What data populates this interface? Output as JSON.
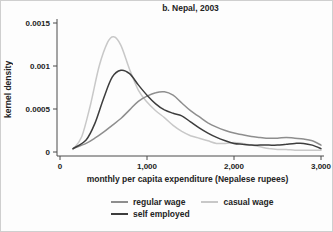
{
  "title": "b. Nepal, 2003",
  "colors": {
    "background": "#fdfdfd",
    "axis": "#4a4a4a",
    "text": "#232323",
    "regular_wage": "#8e8e8e",
    "casual_wage": "#c8c8c8",
    "self_employed": "#3d3d3d"
  },
  "chart_data": {
    "type": "line",
    "title": "b. Nepal, 2003",
    "xlabel": "monthly per capita expenditure (Nepalese rupees)",
    "ylabel": "kernel density",
    "xlim": [
      0,
      3000
    ],
    "ylim": [
      0,
      0.0015
    ],
    "grid": false,
    "legend_position": "bottom",
    "xticks": [
      {
        "value": 0,
        "label": "0"
      },
      {
        "value": 1000,
        "label": "1,000"
      },
      {
        "value": 2000,
        "label": "2,000"
      },
      {
        "value": 3000,
        "label": "3,000"
      }
    ],
    "yticks": [
      {
        "value": 0,
        "label": "0"
      },
      {
        "value": 0.0005,
        "label": "0.0005"
      },
      {
        "value": 0.001,
        "label": "0.001"
      },
      {
        "value": 0.0015,
        "label": "0.0015"
      }
    ],
    "series": [
      {
        "name": "casual wage",
        "color": "#c8c8c8",
        "x": [
          150,
          250,
          350,
          450,
          550,
          620,
          700,
          800,
          900,
          1000,
          1100,
          1200,
          1300,
          1400,
          1500,
          1600,
          1700,
          1800,
          1900,
          2000,
          2100,
          2200,
          2300,
          2400,
          2500,
          2600,
          2700,
          2800,
          2900,
          3000
        ],
        "y": [
          3e-05,
          0.00018,
          0.00055,
          0.001,
          0.00128,
          0.00134,
          0.00124,
          0.00096,
          0.00072,
          0.00058,
          0.00048,
          0.0004,
          0.00031,
          0.00024,
          0.00019,
          0.00016,
          0.00013,
          0.0001,
          0.0001,
          0.00011,
          0.0001,
          8e-05,
          6e-05,
          4e-05,
          3e-05,
          3e-05,
          2e-05,
          2e-05,
          2e-05,
          2e-05
        ]
      },
      {
        "name": "regular wage",
        "color": "#8e8e8e",
        "x": [
          150,
          300,
          400,
          500,
          600,
          700,
          800,
          900,
          1000,
          1100,
          1200,
          1300,
          1400,
          1500,
          1600,
          1700,
          1800,
          1900,
          2000,
          2100,
          2200,
          2300,
          2400,
          2500,
          2600,
          2700,
          2800,
          2900,
          3000
        ],
        "y": [
          4e-05,
          0.0001,
          0.00016,
          0.00023,
          0.00031,
          0.00039,
          0.00049,
          0.00059,
          0.00065,
          0.00069,
          0.0007,
          0.00066,
          0.00057,
          0.00048,
          0.00041,
          0.00034,
          0.00029,
          0.00025,
          0.00022,
          0.0002,
          0.00018,
          0.00017,
          0.00016,
          0.00016,
          0.00017,
          0.00016,
          0.00015,
          0.00013,
          8e-05
        ]
      },
      {
        "name": "self employed",
        "color": "#3d3d3d",
        "x": [
          150,
          300,
          400,
          500,
          600,
          700,
          800,
          900,
          1000,
          1100,
          1200,
          1300,
          1400,
          1500,
          1600,
          1700,
          1800,
          1900,
          2000,
          2100,
          2200,
          2300,
          2400,
          2500,
          2600,
          2700,
          2800,
          2900,
          3000
        ],
        "y": [
          4e-05,
          0.00014,
          0.00033,
          0.00062,
          0.00087,
          0.00095,
          0.00091,
          0.00078,
          0.00066,
          0.00056,
          0.00049,
          0.00045,
          0.00042,
          0.00035,
          0.00028,
          0.00022,
          0.00017,
          0.00013,
          0.0001,
          9e-05,
          8e-05,
          8e-05,
          8e-05,
          8e-05,
          9e-05,
          0.0001,
          0.0001,
          8e-05,
          4e-05
        ]
      }
    ],
    "legend": {
      "rows": [
        [
          "regular wage",
          "casual wage"
        ],
        [
          "self employed"
        ]
      ]
    }
  }
}
